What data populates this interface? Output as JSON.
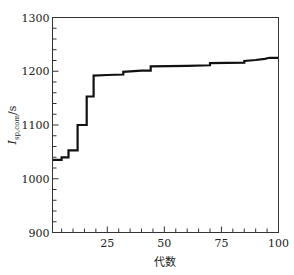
{
  "chart_data": {
    "type": "line",
    "title": "",
    "xlabel": "代数",
    "ylabel": "I_sp,com/s",
    "ylabel_parts": {
      "main": "I",
      "sub": "sp,com",
      "unit": "/s"
    },
    "xlim": [
      1,
      100
    ],
    "ylim": [
      900,
      1300
    ],
    "xticks": [
      25,
      50,
      75,
      100
    ],
    "yticks": [
      900,
      1000,
      1100,
      1200,
      1300
    ],
    "grid": false,
    "legend": null,
    "step": true,
    "series": [
      {
        "name": "best",
        "color": "#111111",
        "x": [
          1,
          5,
          5,
          8,
          8,
          12,
          12,
          16,
          16,
          19,
          19,
          25,
          32,
          32,
          40,
          44,
          44,
          60,
          70,
          70,
          85,
          85,
          90,
          94,
          96,
          100
        ],
        "y": [
          1035,
          1035,
          1040,
          1040,
          1053,
          1053,
          1100,
          1100,
          1153,
          1153,
          1192,
          1193,
          1194,
          1199,
          1201,
          1201,
          1209,
          1210,
          1211,
          1215,
          1216,
          1219,
          1221,
          1223,
          1225,
          1225
        ]
      }
    ]
  }
}
